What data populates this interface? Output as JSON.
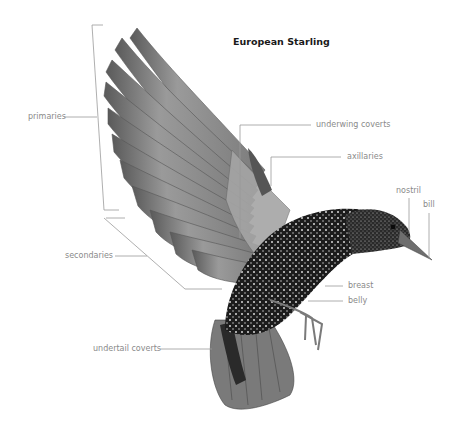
{
  "title": "European Starling",
  "labels": {
    "primaries": "primaries",
    "secondaries": "secondaries",
    "underwing_coverts": "underwing coverts",
    "axillaries": "axillaries",
    "nostril": "nostril",
    "bill": "bill",
    "breast": "breast",
    "belly": "belly",
    "undertail_coverts": "undertail coverts"
  },
  "colors": {
    "leader_line": "#9a9a9a",
    "label_text": "#8a8a8a",
    "title_text": "#1a1a1a",
    "wing_gray": "#8c8c8c",
    "body_dark": "#1e1e1e"
  }
}
